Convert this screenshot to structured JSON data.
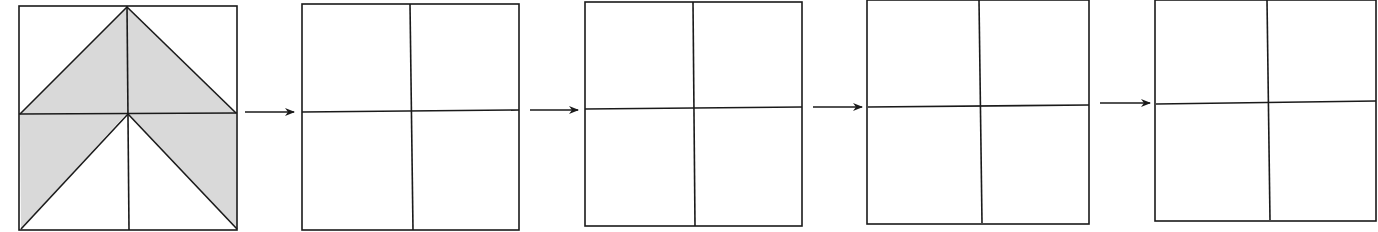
{
  "diagram": {
    "colors": {
      "line": "#1a1a1a",
      "shade": "#d9d9d9",
      "background": "#ffffff"
    },
    "source_square": {
      "x": 19,
      "y": 6,
      "w": 218,
      "h": 224,
      "shaded_regions": [
        "upper chevron: triangle from top-center to left and right midpoints",
        "lower-left triangle: left half of bottom row outside the inverted V",
        "lower-right triangle: right half of bottom row outside the inverted V"
      ]
    },
    "empty_grids": [
      {
        "index": 1,
        "x": 302,
        "y": 4,
        "w": 217,
        "h": 226
      },
      {
        "index": 2,
        "x": 585,
        "y": 2,
        "w": 217,
        "h": 224
      },
      {
        "index": 3,
        "x": 868,
        "y": 0,
        "w": 222,
        "h": 224
      },
      {
        "index": 4,
        "x": 1156,
        "y": 0,
        "w": 220,
        "h": 221
      }
    ],
    "arrows": [
      {
        "index": 1,
        "x1": 245,
        "x2": 294,
        "y": 112
      },
      {
        "index": 2,
        "x1": 530,
        "x2": 578,
        "y": 110
      },
      {
        "index": 3,
        "x1": 813,
        "x2": 862,
        "y": 107
      },
      {
        "index": 4,
        "x1": 1100,
        "x2": 1150,
        "y": 103
      }
    ]
  }
}
